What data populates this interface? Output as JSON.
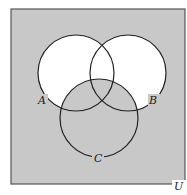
{
  "diagram": {
    "type": "venn",
    "universe_label": "U",
    "sets": [
      {
        "label": "A"
      },
      {
        "label": "B"
      },
      {
        "label": "C"
      }
    ],
    "shaded_region": "complement of (A ∪ B) \\ C",
    "colors": {
      "shade": "#c8c8c8",
      "unshaded": "#ffffff",
      "stroke": "#222222"
    }
  }
}
